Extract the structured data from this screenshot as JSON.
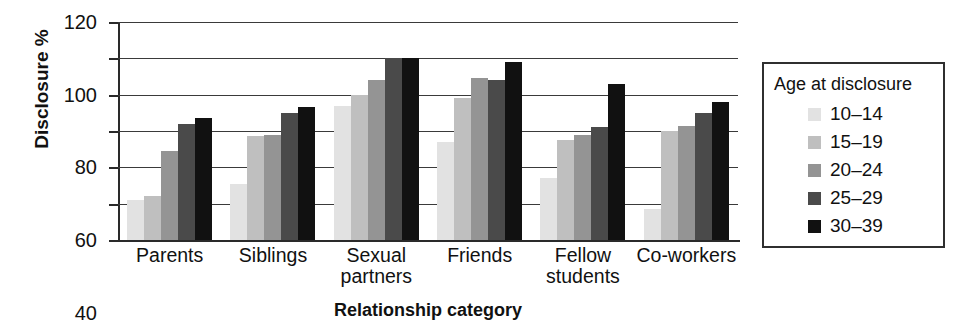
{
  "chart_data": {
    "type": "bar",
    "title": "",
    "xlabel": "Relationship category",
    "ylabel": "Disclosure %",
    "ylim": [
      0,
      120
    ],
    "ytick_step": 20,
    "yticks": [
      120,
      100,
      80,
      60,
      40,
      20,
      0
    ],
    "grid": true,
    "legend_position": "right",
    "legend_title": "Age at disclosure",
    "categories": [
      "Parents",
      "Siblings",
      "Sexual\npartners",
      "Friends",
      "Fellow\nstudents",
      "Co-workers"
    ],
    "series": [
      {
        "name": "10–14",
        "color": "#e2e2e2",
        "values": [
          22,
          31,
          74,
          54,
          34,
          17
        ]
      },
      {
        "name": "15–19",
        "color": "#bfbfbf",
        "values": [
          24,
          57,
          80,
          78,
          55,
          60
        ]
      },
      {
        "name": "20–24",
        "color": "#949494",
        "values": [
          49,
          58,
          88,
          89,
          58,
          63
        ]
      },
      {
        "name": "25–29",
        "color": "#4a4a4a",
        "values": [
          64,
          70,
          100,
          88,
          62,
          70
        ]
      },
      {
        "name": "30–39",
        "color": "#111111",
        "values": [
          67,
          73,
          100,
          98,
          86,
          76
        ]
      }
    ],
    "extra_bar_note": "",
    "axis_color": "#2a2a2a",
    "grid_color": "#3a3a3a",
    "background": "#ffffff"
  }
}
